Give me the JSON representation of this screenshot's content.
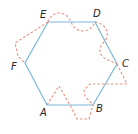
{
  "diagram": {
    "colors": {
      "hexagon": "#7ab8dc",
      "dashed": "#e8907e",
      "label": "#222222"
    },
    "vertices": [
      {
        "id": "A",
        "label": "A",
        "x": 47,
        "y": 105
      },
      {
        "id": "B",
        "label": "B",
        "x": 93,
        "y": 105
      },
      {
        "id": "C",
        "label": "C",
        "x": 117,
        "y": 64
      },
      {
        "id": "D",
        "label": "D",
        "x": 95,
        "y": 22
      },
      {
        "id": "E",
        "label": "E",
        "x": 48,
        "y": 22
      },
      {
        "id": "F",
        "label": "F",
        "x": 25,
        "y": 63
      }
    ],
    "labels": {
      "A": "A",
      "B": "B",
      "C": "C",
      "D": "D",
      "E": "E",
      "F": "F"
    }
  }
}
